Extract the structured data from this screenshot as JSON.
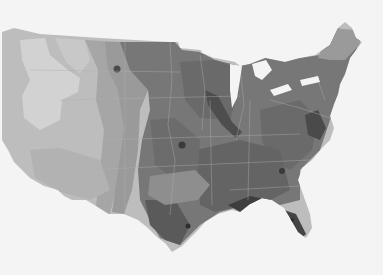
{
  "map": {
    "title": "",
    "region": "Contiguous United States",
    "style": "grayscale contour / choropleth",
    "colors": {
      "background": "#f4f4f4",
      "level_1": "#d2d2d2",
      "level_2": "#bdbdbd",
      "level_3": "#a6a6a6",
      "level_4": "#8e8e8e",
      "level_5": "#767676",
      "level_6": "#5e5e5e",
      "level_7": "#444444",
      "state_lines": "#b0b0b0"
    },
    "legend": null,
    "labels": []
  }
}
